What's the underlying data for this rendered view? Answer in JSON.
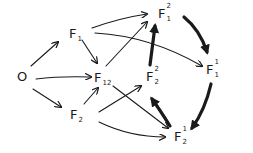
{
  "diagram": {
    "type": "directed-graph",
    "style": "hand-drawn",
    "colors": {
      "ink": "#1a1a1a",
      "background": "#ffffff"
    },
    "nodes": [
      {
        "id": "O",
        "base": "O",
        "sup": "",
        "sub": ""
      },
      {
        "id": "F1",
        "base": "F",
        "sup": "",
        "sub": "1"
      },
      {
        "id": "F12",
        "base": "F",
        "sup": "",
        "sub": "12"
      },
      {
        "id": "F2",
        "base": "F",
        "sup": "",
        "sub": "2"
      },
      {
        "id": "F1^2",
        "base": "F",
        "sup": "2",
        "sub": "1"
      },
      {
        "id": "F2^2",
        "base": "F",
        "sup": "2",
        "sub": "2"
      },
      {
        "id": "F1^1",
        "base": "F",
        "sup": "1",
        "sub": "1"
      },
      {
        "id": "F2^1",
        "base": "F",
        "sup": "1",
        "sub": "2"
      }
    ],
    "edges": [
      {
        "from": "O",
        "to": "F1",
        "weight": "thin"
      },
      {
        "from": "O",
        "to": "F12",
        "weight": "thin"
      },
      {
        "from": "O",
        "to": "F2",
        "weight": "thin"
      },
      {
        "from": "F1",
        "to": "F12",
        "weight": "thin"
      },
      {
        "from": "F2",
        "to": "F12",
        "weight": "thin"
      },
      {
        "from": "F1",
        "to": "F1^2",
        "weight": "thin"
      },
      {
        "from": "F1",
        "to": "F1^1",
        "weight": "thin"
      },
      {
        "from": "F12",
        "to": "F1^2",
        "weight": "thin"
      },
      {
        "from": "F12",
        "to": "F2^1",
        "weight": "thin"
      },
      {
        "from": "F2",
        "to": "F2^2",
        "weight": "thin"
      },
      {
        "from": "F2",
        "to": "F2^1",
        "weight": "thin"
      },
      {
        "from": "F1^2",
        "to": "F1^1",
        "weight": "thick"
      },
      {
        "from": "F1^1",
        "to": "F2^1",
        "weight": "thick"
      },
      {
        "from": "F2^1",
        "to": "F2^2",
        "weight": "thick"
      },
      {
        "from": "F2^2",
        "to": "F1^2",
        "weight": "thick"
      }
    ]
  }
}
